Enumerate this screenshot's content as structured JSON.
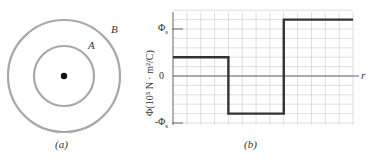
{
  "figure_a": {
    "caption": "(a)",
    "label_inner": "A",
    "label_outer": "B",
    "circle_color": "#a8a8a8",
    "center_dot_color": "#111111"
  },
  "figure_b": {
    "caption": "(b)"
  },
  "chart_data": {
    "type": "line",
    "title": "",
    "xlabel": "r",
    "ylabel": "Φ(10⁵ N · m²/C)",
    "ytick_labels": [
      "Φs",
      "0",
      "-Φs"
    ],
    "yticks": [
      1,
      0,
      -1
    ],
    "ylim": [
      -1.1,
      1.5
    ],
    "grid": true,
    "step": true,
    "x": [
      0,
      4,
      4,
      8,
      8,
      13
    ],
    "y": [
      0.4,
      0.4,
      -0.8,
      -0.8,
      1.2,
      1.2
    ],
    "segments": [
      {
        "x_start": 0,
        "x_end": 4,
        "value": 0.4
      },
      {
        "x_start": 4,
        "x_end": 8,
        "value": -0.8
      },
      {
        "x_start": 8,
        "x_end": 13,
        "value": 1.2
      }
    ],
    "grid_columns": 13,
    "line_color": "#333333",
    "grid_color": "#d6d6d6"
  }
}
